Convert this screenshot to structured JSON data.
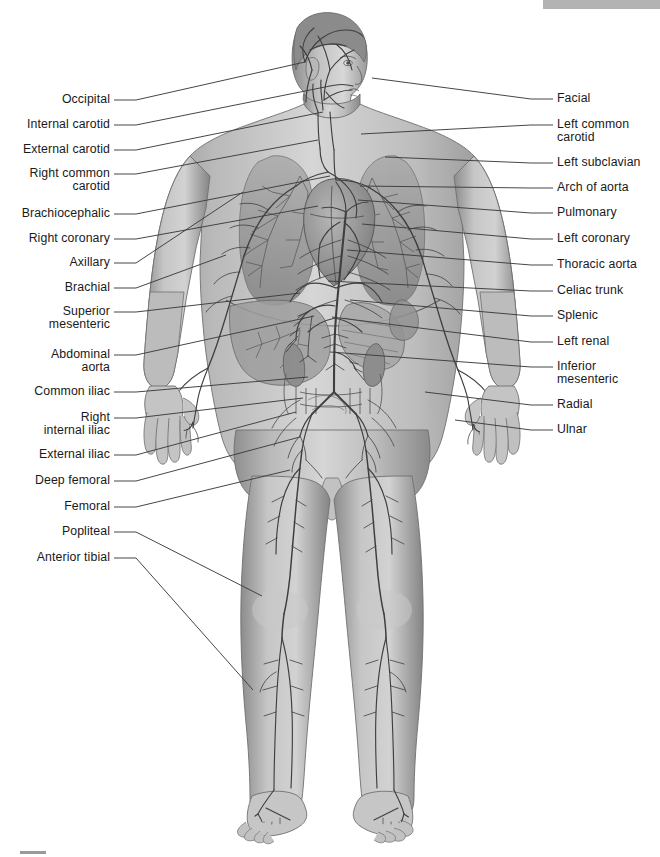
{
  "diagram": {
    "style": "grayscale medical illustration with leader-line callouts",
    "colors": {
      "background": "#ffffff",
      "label_text": "#1a1a1a",
      "leader_line": "#3c3c3c",
      "artery_line": "#4a4a4a",
      "body_light": "#d4d4d4",
      "body_mid": "#a8a8a8",
      "body_shadow": "#7a7a7a",
      "organ_dark": "#6e6e6e",
      "top_bar": "#b3b3b3"
    }
  },
  "top_bar": {
    "name": "header-band",
    "visible": true
  },
  "bottom_mark": {
    "name": "footer-tick",
    "visible": true
  },
  "labels_left": [
    {
      "text": "Occipital",
      "y": 100,
      "lines": 1,
      "tx": 305,
      "ty": 62
    },
    {
      "text": "Internal carotid",
      "y": 125,
      "lines": 1,
      "tx": 330,
      "ty": 86
    },
    {
      "text": "External carotid",
      "y": 150,
      "lines": 1,
      "tx": 323,
      "ty": 112
    },
    {
      "text": "Right common\ncarotid",
      "y": 180,
      "lines": 2,
      "tx": 318,
      "ty": 140
    },
    {
      "text": "Brachiocephalic",
      "y": 214,
      "lines": 1,
      "tx": 330,
      "ty": 176
    },
    {
      "text": "Right coronary",
      "y": 239,
      "lines": 1,
      "tx": 318,
      "ty": 206
    },
    {
      "text": "Axillary",
      "y": 263,
      "lines": 1,
      "tx": 243,
      "ty": 192
    },
    {
      "text": "Brachial",
      "y": 288,
      "lines": 1,
      "tx": 226,
      "ty": 255
    },
    {
      "text": "Superior\nmesenteric",
      "y": 318,
      "lines": 2,
      "tx": 300,
      "ty": 293
    },
    {
      "text": "Abdominal\naorta",
      "y": 361,
      "lines": 2,
      "tx": 314,
      "ty": 316
    },
    {
      "text": "Common iliac",
      "y": 392,
      "lines": 1,
      "tx": 308,
      "ty": 377
    },
    {
      "text": "Right\ninternal iliac",
      "y": 424,
      "lines": 2,
      "tx": 303,
      "ty": 398
    },
    {
      "text": "External iliac",
      "y": 455,
      "lines": 1,
      "tx": 296,
      "ty": 412
    },
    {
      "text": "Deep femoral",
      "y": 481,
      "lines": 1,
      "tx": 300,
      "ty": 437
    },
    {
      "text": "Femoral",
      "y": 507,
      "lines": 1,
      "tx": 290,
      "ty": 470
    },
    {
      "text": "Popliteal",
      "y": 532,
      "lines": 1,
      "tx": 262,
      "ty": 596
    },
    {
      "text": "Anterior tibial",
      "y": 558,
      "lines": 1,
      "tx": 253,
      "ty": 690
    }
  ],
  "labels_right": [
    {
      "text": "Facial",
      "y": 99,
      "lines": 1,
      "tx": 372,
      "ty": 78
    },
    {
      "text": "Left common\ncarotid",
      "y": 131,
      "lines": 2,
      "tx": 361,
      "ty": 134
    },
    {
      "text": "Left subclavian",
      "y": 163,
      "lines": 1,
      "tx": 385,
      "ty": 157
    },
    {
      "text": "Arch of aorta",
      "y": 188,
      "lines": 1,
      "tx": 360,
      "ty": 186
    },
    {
      "text": "Pulmonary",
      "y": 213,
      "lines": 1,
      "tx": 358,
      "ty": 200
    },
    {
      "text": "Left coronary",
      "y": 239,
      "lines": 1,
      "tx": 362,
      "ty": 224
    },
    {
      "text": "Thoracic aorta",
      "y": 265,
      "lines": 1,
      "tx": 347,
      "ty": 250
    },
    {
      "text": "Celiac trunk",
      "y": 291,
      "lines": 1,
      "tx": 328,
      "ty": 281
    },
    {
      "text": "Splenic",
      "y": 316,
      "lines": 1,
      "tx": 350,
      "ty": 300
    },
    {
      "text": "Left renal",
      "y": 342,
      "lines": 1,
      "tx": 332,
      "ty": 317
    },
    {
      "text": "Inferior\nmesenteric",
      "y": 373,
      "lines": 2,
      "tx": 330,
      "ty": 352
    },
    {
      "text": "Radial",
      "y": 405,
      "lines": 1,
      "tx": 425,
      "ty": 392
    },
    {
      "text": "Ulnar",
      "y": 430,
      "lines": 1,
      "tx": 455,
      "ty": 420
    }
  ],
  "figure_parts": [
    "head",
    "neck",
    "torso",
    "lungs",
    "heart",
    "liver",
    "stomach",
    "intestines",
    "kidneys",
    "left-arm",
    "right-arm",
    "left-hand",
    "right-hand",
    "pelvis",
    "left-leg",
    "right-leg",
    "left-foot",
    "right-foot"
  ]
}
